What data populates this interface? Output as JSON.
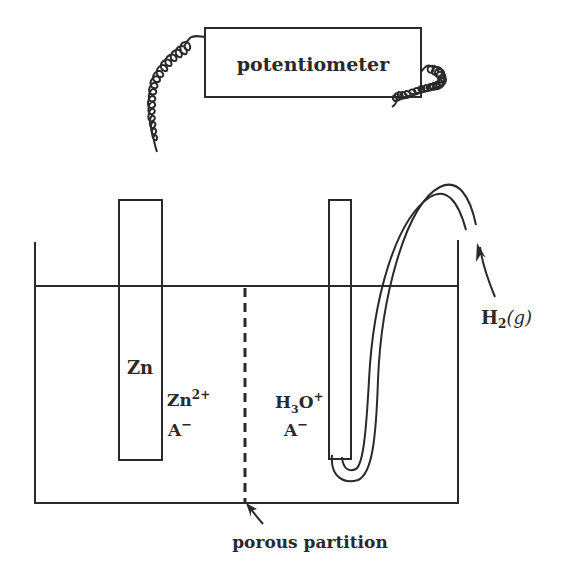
{
  "diagram": {
    "potentiometer": {
      "label": "potentiometer"
    },
    "left_half_cell": {
      "electrode_label": "Zn",
      "ions": {
        "cation_base": "Zn",
        "cation_charge": "2+",
        "anion": "A",
        "anion_charge": "−"
      }
    },
    "right_half_cell": {
      "ions": {
        "cation_base": "H",
        "cation_sub": "3",
        "cation_rest": "O",
        "cation_charge": "+",
        "anion": "A",
        "anion_charge": "−"
      }
    },
    "gas_label": {
      "base": "H",
      "sub": "2",
      "state": "(g)"
    },
    "partition_label": "porous partition",
    "colors": {
      "ink": "#2a2a2a",
      "background": "#ffffff"
    }
  }
}
